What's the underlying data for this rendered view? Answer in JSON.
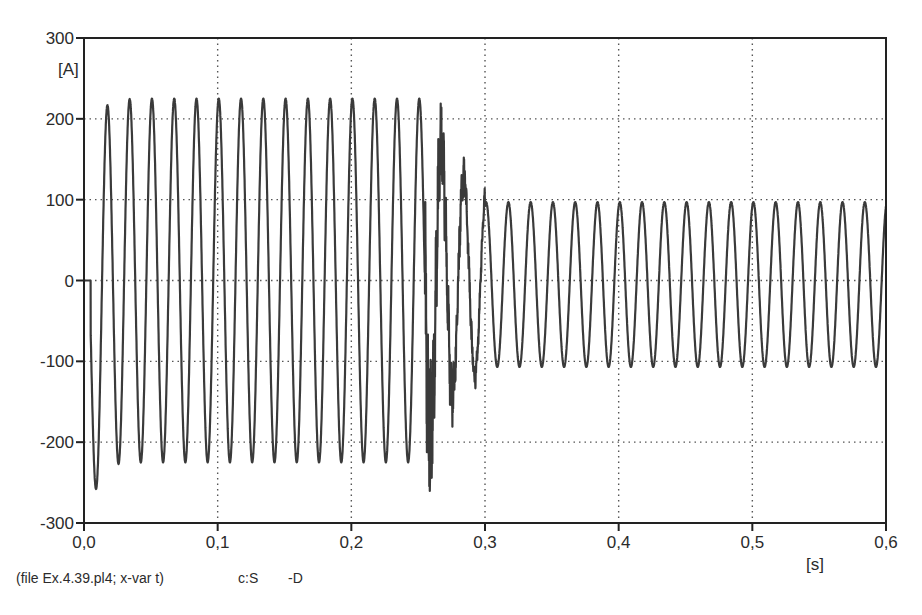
{
  "chart_data": {
    "type": "line",
    "title": "",
    "xlabel": "[s]",
    "ylabel": "[A]",
    "xlim": [
      0.0,
      0.6
    ],
    "ylim": [
      -300,
      300
    ],
    "grid": true,
    "grid_style": "dotted",
    "legend": null,
    "x_ticks": [
      "0,0",
      "0,1",
      "0,2",
      "0,3",
      "0,4",
      "0,5",
      "0,6"
    ],
    "x_tick_values": [
      0.0,
      0.1,
      0.2,
      0.3,
      0.4,
      0.5,
      0.6
    ],
    "y_ticks": [
      "300",
      "200",
      "100",
      "0",
      "-100",
      "-200",
      "-300"
    ],
    "y_tick_values": [
      300,
      200,
      100,
      0,
      -100,
      -200,
      -300
    ],
    "series": [
      {
        "name": "c:S -D",
        "description": "Current waveform: 60 Hz sinusoid, zero until ~0.005 s, pre-fault amplitude ~225 A with initial trough ~-290 A; high-frequency transient 0.255–0.30 s (peak ~250 A, min ~-215 A); post-fault amplitude ~100 A to 0.6 s",
        "frequency_hz": 60,
        "segments": [
          {
            "t_start": 0.0,
            "t_end": 0.005,
            "amplitude": 0
          },
          {
            "t_start": 0.005,
            "t_end": 0.255,
            "amplitude": 225,
            "first_min": -290
          },
          {
            "t_start": 0.255,
            "t_end": 0.3,
            "transient": true,
            "peak": 250,
            "min": -215
          },
          {
            "t_start": 0.3,
            "t_end": 0.6,
            "amplitude": 100
          }
        ],
        "key_points": [
          {
            "t": 0.0,
            "i": 0
          },
          {
            "t": 0.005,
            "i": 0
          },
          {
            "t": 0.013,
            "i": -290
          },
          {
            "t": 0.022,
            "i": 210
          },
          {
            "t": 0.03,
            "i": -230
          },
          {
            "t": 0.038,
            "i": 225
          },
          {
            "t": 0.255,
            "i": 250
          },
          {
            "t": 0.262,
            "i": -215
          },
          {
            "t": 0.27,
            "i": 150
          },
          {
            "t": 0.282,
            "i": 105
          },
          {
            "t": 0.29,
            "i": -120
          },
          {
            "t": 0.3,
            "i": 90
          },
          {
            "t": 0.31,
            "i": -110
          },
          {
            "t": 0.6,
            "i": -110
          }
        ]
      }
    ]
  },
  "footer": {
    "file_info": "(file Ex.4.39.pl4; x-var t)",
    "curve_id": "c:S",
    "curve_suffix": "-D"
  },
  "axes": {
    "y_unit": "[A]",
    "x_unit": "[s]"
  },
  "colors": {
    "trace": "#3a3a3a",
    "axis": "#222222",
    "grid": "#555555",
    "background": "#ffffff"
  }
}
